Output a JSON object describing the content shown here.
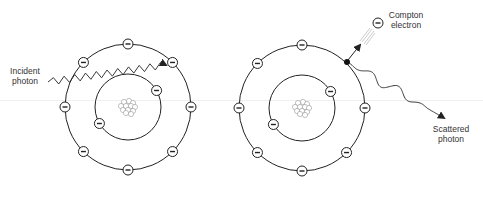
{
  "diagram": {
    "colors": {
      "line": "#222222",
      "nucleon": "#999999",
      "background": "#ffffff"
    },
    "atoms": [
      {
        "id": "atom-before",
        "outer_electrons": 8,
        "inner_electrons": 2,
        "electron_symbol": "−"
      },
      {
        "id": "atom-after",
        "outer_electrons": 7,
        "inner_electrons": 2,
        "electron_symbol": "−",
        "ejected_electron_marker": "dot"
      }
    ],
    "labels": {
      "incident_photon": [
        "Incident",
        "photon"
      ],
      "compton_electron": [
        "Compton",
        "electron"
      ],
      "scattered_photon": [
        "Scattered",
        "photon"
      ]
    },
    "compton_electron_symbol": "−"
  }
}
